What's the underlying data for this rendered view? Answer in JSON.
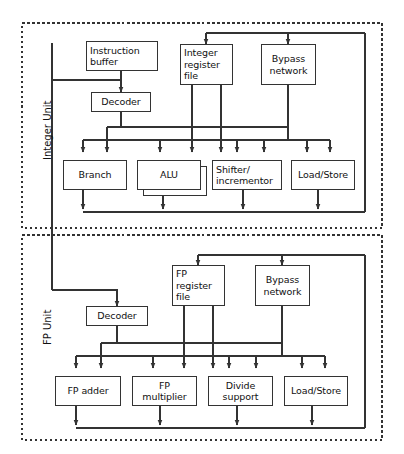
{
  "diagram": {
    "line_color": "#333333",
    "box_fill": "#ffffff",
    "units": [
      {
        "id": "integer-unit",
        "label": "Integer Unit",
        "dashed_box": {
          "x": 22,
          "y": 23,
          "w": 360,
          "h": 205
        },
        "solid_box": {
          "x": 52,
          "y": 43,
          "w": 313,
          "h": 176
        },
        "nodes": [
          {
            "id": "instruction-buffer",
            "label": "Instruction\nbuffer",
            "align": "left",
            "x": 86,
            "y": 41,
            "w": 72,
            "h": 30
          },
          {
            "id": "integer-register-file",
            "label": "Integer\nregister\nfile",
            "align": "left",
            "x": 180,
            "y": 44,
            "w": 53,
            "h": 41
          },
          {
            "id": "bypass-network",
            "label": "Bypass\nnetwork",
            "align": "center",
            "x": 261,
            "y": 44,
            "w": 55,
            "h": 41
          },
          {
            "id": "decoder",
            "label": "Decoder",
            "align": "center",
            "x": 91,
            "y": 92,
            "w": 60,
            "h": 20
          },
          {
            "id": "branch",
            "label": "Branch",
            "align": "center",
            "x": 63,
            "y": 160,
            "w": 64,
            "h": 30
          },
          {
            "id": "alu",
            "label": "ALU",
            "align": "center",
            "x": 137,
            "y": 160,
            "w": 64,
            "h": 30
          },
          {
            "id": "shifter-incrementor",
            "label": "Shifter/\nincrementor",
            "align": "left",
            "x": 212,
            "y": 160,
            "w": 70,
            "h": 30
          },
          {
            "id": "load-store-int",
            "label": "Load/Store",
            "align": "center",
            "x": 291,
            "y": 160,
            "w": 64,
            "h": 30
          }
        ]
      },
      {
        "id": "fp-unit",
        "label": "FP Unit",
        "dashed_box": {
          "x": 22,
          "y": 235,
          "w": 360,
          "h": 205
        },
        "solid_box": {
          "x": 52,
          "y": 243,
          "w": 313,
          "h": 176
        },
        "nodes": [
          {
            "id": "fp-register-file",
            "label": "FP\nregister\nfile",
            "align": "left",
            "x": 172,
            "y": 265,
            "w": 53,
            "h": 41
          },
          {
            "id": "fp-bypass-network",
            "label": "Bypass\nnetwork",
            "align": "center",
            "x": 255,
            "y": 265,
            "w": 55,
            "h": 41
          },
          {
            "id": "fp-decoder",
            "label": "Decoder",
            "align": "center",
            "x": 86,
            "y": 306,
            "w": 62,
            "h": 20
          },
          {
            "id": "fp-adder",
            "label": "FP adder",
            "align": "center",
            "x": 55,
            "y": 376,
            "w": 66,
            "h": 30
          },
          {
            "id": "fp-multiplier",
            "label": "FP\nmultiplier",
            "align": "center",
            "x": 132,
            "y": 376,
            "w": 65,
            "h": 30
          },
          {
            "id": "divide-support",
            "label": "Divide\nsupport",
            "align": "center",
            "x": 208,
            "y": 376,
            "w": 65,
            "h": 30
          },
          {
            "id": "load-store-fp",
            "label": "Load/Store",
            "align": "center",
            "x": 284,
            "y": 376,
            "w": 64,
            "h": 30
          }
        ]
      }
    ]
  }
}
